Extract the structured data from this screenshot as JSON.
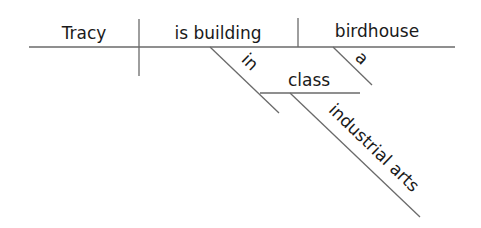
{
  "diagram": {
    "type": "sentence-diagram",
    "sentence": "Tracy is building a birdhouse in industrial arts class",
    "subject": "Tracy",
    "verb": "is building",
    "direct_object": "birdhouse",
    "object_modifier": "a",
    "preposition": "in",
    "prepositional_object": "class",
    "object_of_prep_modifier": "industrial arts",
    "line_color": "#6a6a6a",
    "text_color": "#1a1a1a"
  }
}
